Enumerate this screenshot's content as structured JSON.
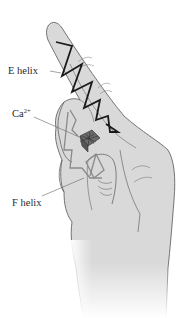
{
  "figure": {
    "labels": {
      "e_helix": "E helix",
      "calcium_base": "Ca",
      "calcium_charge": "2+",
      "f_helix": "F helix"
    },
    "colors": {
      "background": "#ffffff",
      "hand_fill": "#d9d9d9",
      "hand_outline": "#555555",
      "e_helix": "#1a1a1a",
      "f_helix": "#8a8a8a",
      "calcium": "#5a5a5a",
      "leader_line": "#666666",
      "label_text": "#2a2a2a"
    }
  }
}
